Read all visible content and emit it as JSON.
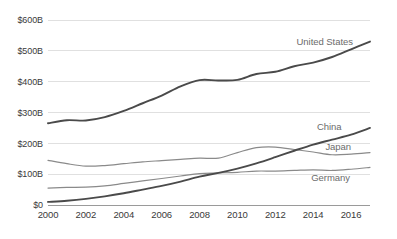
{
  "chart_data": {
    "type": "line",
    "title": "",
    "subtitle": "",
    "xlabel": "",
    "ylabel": "",
    "grid": "horizontal",
    "legend_position": "inline-right-end-labels",
    "x": [
      2000,
      2001,
      2002,
      2003,
      2004,
      2005,
      2006,
      2007,
      2008,
      2009,
      2010,
      2011,
      2012,
      2013,
      2014,
      2015,
      2016,
      2017
    ],
    "xlim": [
      2000,
      2017
    ],
    "ylim": [
      0,
      600
    ],
    "y_unit": "billions of USD",
    "x_tick_labels": [
      "2000",
      "2002",
      "2004",
      "2006",
      "2008",
      "2010",
      "2012",
      "2014",
      "2016"
    ],
    "x_tick_values": [
      2000,
      2002,
      2004,
      2006,
      2008,
      2010,
      2012,
      2014,
      2016
    ],
    "y_tick_labels": [
      "$0",
      "$100B",
      "$200B",
      "$300B",
      "$400B",
      "$500B",
      "$600B"
    ],
    "y_tick_values": [
      0,
      100,
      200,
      300,
      400,
      500,
      600
    ],
    "series": [
      {
        "name": "United States",
        "color": "#4a4a4a",
        "width": 1.9,
        "label_x": 2016.1,
        "label_y": 520,
        "values": [
          265,
          275,
          274,
          285,
          305,
          330,
          355,
          385,
          405,
          404,
          406,
          425,
          432,
          450,
          462,
          480,
          505,
          530
        ]
      },
      {
        "name": "China",
        "color": "#4a4a4a",
        "width": 1.9,
        "label_x": 2014.2,
        "label_y": 243,
        "values": [
          10,
          14,
          20,
          28,
          38,
          50,
          62,
          76,
          92,
          104,
          118,
          135,
          155,
          176,
          196,
          212,
          228,
          250
        ]
      },
      {
        "name": "Japan",
        "color": "#8a8a8a",
        "width": 1.2,
        "label_x": 2016.0,
        "label_y": 178,
        "values": [
          145,
          134,
          126,
          128,
          134,
          140,
          144,
          148,
          152,
          152,
          170,
          186,
          188,
          180,
          172,
          163,
          165,
          170
        ]
      },
      {
        "name": "Germany",
        "color": "#8a8a8a",
        "width": 1.2,
        "label_x": 2013.9,
        "label_y": 78,
        "values": [
          55,
          57,
          58,
          62,
          70,
          78,
          86,
          94,
          102,
          104,
          106,
          110,
          110,
          112,
          114,
          112,
          116,
          122
        ]
      }
    ]
  }
}
